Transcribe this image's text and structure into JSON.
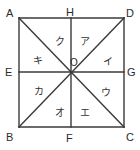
{
  "figure": {
    "kind": "geometry-diagram",
    "colors": {
      "background": "#ffffff",
      "stroke": "#3a3a3a",
      "label": "#2b2b2b",
      "region_label": "#333333"
    },
    "square": {
      "x": 19,
      "y": 18,
      "width": 105,
      "height": 109
    },
    "stroke_width": 1.4,
    "vertices": [
      {
        "id": "A",
        "label": "A",
        "px": 19,
        "py": 18,
        "lx": 6,
        "ly": 8,
        "corner": "top-left"
      },
      {
        "id": "H",
        "label": "H",
        "px": 71,
        "py": 18,
        "lx": 66,
        "ly": 7,
        "corner": "top-mid"
      },
      {
        "id": "D",
        "label": "D",
        "px": 124,
        "py": 18,
        "lx": 126,
        "ly": 8,
        "corner": "top-right"
      },
      {
        "id": "E",
        "label": "E",
        "px": 19,
        "py": 72,
        "lx": 5,
        "ly": 67,
        "corner": "left-mid"
      },
      {
        "id": "G",
        "label": "G",
        "px": 124,
        "py": 72,
        "lx": 127,
        "ly": 67,
        "corner": "right-mid"
      },
      {
        "id": "B",
        "label": "B",
        "px": 19,
        "py": 127,
        "lx": 6,
        "ly": 132,
        "corner": "bottom-left"
      },
      {
        "id": "F",
        "label": "F",
        "px": 71,
        "py": 127,
        "lx": 66,
        "ly": 133,
        "corner": "bottom-mid"
      },
      {
        "id": "C",
        "label": "C",
        "px": 124,
        "py": 127,
        "lx": 126,
        "ly": 132,
        "corner": "bottom-right"
      }
    ],
    "center": {
      "id": "O",
      "label": "O",
      "px": 71,
      "py": 72,
      "lx": 70,
      "ly": 58
    },
    "regions": [
      {
        "id": "a",
        "label": "ア",
        "lx": 80,
        "ly": 37,
        "position": "upper-right-inner"
      },
      {
        "id": "i",
        "label": "イ",
        "lx": 103,
        "ly": 57,
        "position": "right-upper-outer"
      },
      {
        "id": "u",
        "label": "ウ",
        "lx": 101,
        "ly": 88,
        "position": "right-lower-outer"
      },
      {
        "id": "e",
        "label": "エ",
        "lx": 80,
        "ly": 108,
        "position": "lower-right-inner"
      },
      {
        "id": "o",
        "label": "オ",
        "lx": 55,
        "ly": 108,
        "position": "lower-left-inner"
      },
      {
        "id": "ka",
        "label": "カ",
        "lx": 34,
        "ly": 87,
        "position": "left-lower-outer"
      },
      {
        "id": "ki",
        "label": "キ",
        "lx": 33,
        "ly": 56,
        "position": "left-upper-outer"
      },
      {
        "id": "ku",
        "label": "ク",
        "lx": 55,
        "ly": 37,
        "position": "upper-left-inner"
      }
    ],
    "segments": [
      {
        "id": "side-top",
        "from": "A",
        "to": "D",
        "kind": "square-side"
      },
      {
        "id": "side-right",
        "from": "D",
        "to": "C",
        "kind": "square-side"
      },
      {
        "id": "side-bottom",
        "from": "C",
        "to": "B",
        "kind": "square-side"
      },
      {
        "id": "side-left",
        "from": "B",
        "to": "A",
        "kind": "square-side"
      },
      {
        "id": "diagonal-ac",
        "from": "A",
        "to": "C",
        "kind": "diagonal"
      },
      {
        "id": "diagonal-bd",
        "from": "B",
        "to": "D",
        "kind": "diagonal"
      },
      {
        "id": "midline-eg",
        "from": "E",
        "to": "G",
        "kind": "midline-horizontal"
      },
      {
        "id": "midline-hf",
        "from": "H",
        "to": "F",
        "kind": "midline-vertical"
      }
    ]
  }
}
